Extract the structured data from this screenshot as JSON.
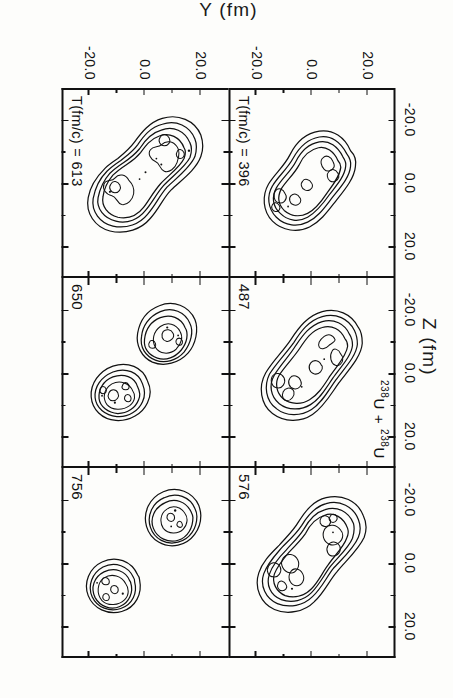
{
  "figure": {
    "system_label_pre": "238",
    "system_label": "U + ",
    "system_label_mid": "238",
    "system_label_post": "U",
    "system_label_full": "238U + 238U",
    "x_axis_title": "Z (fm)",
    "y_axis_title": "Y (fm)",
    "axis_unit": "fm",
    "time_unit": "fm/c"
  },
  "axes": {
    "x_ticks": [
      "-20.0",
      "0.0",
      "20.0"
    ],
    "y_ticks": [
      "-20.0",
      "0.0",
      "20.0"
    ],
    "x_range": [
      -30.0,
      30.0
    ],
    "y_range": [
      -30.0,
      30.0
    ],
    "minor_ticks_per_interval": 1
  },
  "panels": [
    {
      "id": "p396",
      "label": "T(fm/c) = 396",
      "time": 396,
      "row": 0,
      "col": 0,
      "state": "elongated-dumbbell",
      "fragments": 1
    },
    {
      "id": "p487",
      "label": "487",
      "time": 487,
      "row": 0,
      "col": 1,
      "state": "necked-dumbbell",
      "fragments": 1
    },
    {
      "id": "p576",
      "label": "576",
      "time": 576,
      "row": 0,
      "col": 2,
      "state": "thin-neck-dumbbell",
      "fragments": 1
    },
    {
      "id": "p613",
      "label": "T(fm/c) = 613",
      "time": 613,
      "row": 1,
      "col": 0,
      "state": "breaking-neck",
      "fragments": 1
    },
    {
      "id": "p650",
      "label": "650",
      "time": 650,
      "row": 1,
      "col": 1,
      "state": "separated",
      "fragments": 2
    },
    {
      "id": "p756",
      "label": "756",
      "time": 756,
      "row": 1,
      "col": 2,
      "state": "separated-round",
      "fragments": 2
    }
  ],
  "chart_data": {
    "type": "contour",
    "title": "238U + 238U",
    "xlabel": "Z (fm)",
    "ylabel": "Y (fm)",
    "xlim": [
      -30.0,
      30.0
    ],
    "ylim": [
      -30.0,
      30.0
    ],
    "xticks": [
      -20.0,
      0.0,
      20.0
    ],
    "yticks": [
      -20.0,
      0.0,
      20.0
    ],
    "grid": false,
    "legend": null,
    "contour_levels": 4,
    "quantity": "nuclear density",
    "panel_times_fm_per_c": [
      396,
      487,
      576,
      613,
      650,
      756
    ],
    "panel_layout": "3 columns x 2 rows",
    "series": [
      {
        "name": "T = 396 fm/c",
        "description": "single elongated dumbbell, thick neck, two internal density maxima",
        "fragments": 1,
        "neck_present": true
      },
      {
        "name": "T = 487 fm/c",
        "description": "dumbbell with pronounced neck, two lobes separated along diagonal",
        "fragments": 1,
        "neck_present": true
      },
      {
        "name": "T = 576 fm/c",
        "description": "dumbbell with very thin neck about to rupture",
        "fragments": 1,
        "neck_present": true
      },
      {
        "name": "T = 613 fm/c",
        "description": "neck at point of rupture, lobes nearly detached",
        "fragments": 1,
        "neck_present": true
      },
      {
        "name": "T = 650 fm/c",
        "description": "two separated irregular fragments",
        "fragments": 2,
        "neck_present": false
      },
      {
        "name": "T = 756 fm/c",
        "description": "two well-separated nearly spherical fragments",
        "fragments": 2,
        "neck_present": false
      }
    ]
  }
}
